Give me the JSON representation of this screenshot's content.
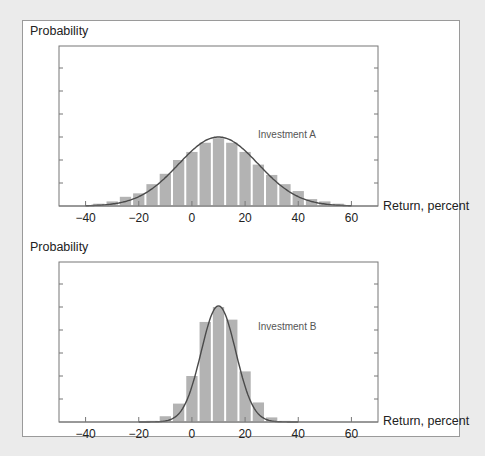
{
  "chart_data": [
    {
      "type": "bar",
      "title": "Investment A",
      "ylabel": "Probability",
      "xlabel": "Return, percent",
      "x_ticks": [
        -40,
        -20,
        0,
        20,
        40,
        60
      ],
      "x_tick_labels": [
        "−40",
        "−20",
        "0",
        "20",
        "40",
        "60"
      ],
      "xlim": [
        -50,
        70
      ],
      "ylim": [
        0,
        7
      ],
      "y_ticks_unlabeled": 6,
      "bar_width": 5,
      "categories": [
        -35,
        -30,
        -25,
        -20,
        -15,
        -10,
        -5,
        0,
        5,
        10,
        15,
        20,
        25,
        30,
        35,
        40,
        45,
        50,
        55
      ],
      "values": [
        0.1,
        0.2,
        0.4,
        0.55,
        0.95,
        1.4,
        2.0,
        2.35,
        2.75,
        2.95,
        2.75,
        2.35,
        1.8,
        1.35,
        0.95,
        0.65,
        0.3,
        0.2,
        0.1
      ],
      "overlay_curve": {
        "type": "normal",
        "mean": 10,
        "peak": 3.0,
        "sd": 15,
        "range": [
          -40,
          60
        ]
      },
      "annotation": "Investment A",
      "grid": false
    },
    {
      "type": "bar",
      "title": "Investment B",
      "ylabel": "Probability",
      "xlabel": "Return, percent",
      "x_ticks": [
        -40,
        -20,
        0,
        20,
        40,
        60
      ],
      "x_tick_labels": [
        "−40",
        "−20",
        "0",
        "20",
        "40",
        "60"
      ],
      "xlim": [
        -50,
        70
      ],
      "ylim": [
        0,
        7
      ],
      "y_ticks_unlabeled": 6,
      "bar_width": 5,
      "categories": [
        -15,
        -10,
        -5,
        0,
        5,
        10,
        15,
        20,
        25,
        30,
        35
      ],
      "values": [
        0.05,
        0.25,
        0.8,
        2.0,
        4.35,
        5.0,
        4.45,
        2.2,
        0.85,
        0.2,
        0.05
      ],
      "overlay_curve": {
        "type": "normal",
        "mean": 10,
        "peak": 5.05,
        "sd": 6.5,
        "range": [
          -20,
          40
        ]
      },
      "annotation": "Investment B",
      "grid": false
    }
  ],
  "labels": {
    "a_ylabel": "Probability",
    "a_xlabel": "Return, percent",
    "b_ylabel": "Probability",
    "b_xlabel": "Return, percent"
  },
  "colors": {
    "bar": "#b3b3b3",
    "curve": "#4a4a4a",
    "axis": "#777777",
    "background": "#ebebeb",
    "panel": "#ffffff"
  }
}
